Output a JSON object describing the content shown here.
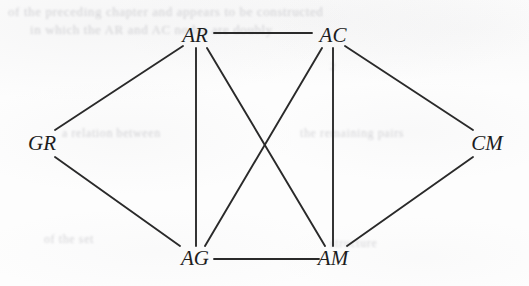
{
  "figure": {
    "background_color": "#fdfdfd",
    "edge_color": "#2a2a2a",
    "label_color": "#1d1d1d",
    "width": 529,
    "height": 286
  },
  "ghost_bleed_text": {
    "description": "faint illegible show-through text from reverse side of page",
    "lines": [
      "of the preceding chapter and appears to be  constructed",
      "in  which  the  AR  and  AC  nodes  are  doubly",
      "a  relation  between",
      "the  remaining  pairs",
      "of  the  set",
      "structure",
      "2"
    ]
  },
  "chart_data": {
    "type": "diagram",
    "diagram_kind": "undirected-graph",
    "title": "",
    "nodes": [
      {
        "id": "AR",
        "label": "AR",
        "x": 195,
        "y": 35,
        "degree": 4
      },
      {
        "id": "AC",
        "label": "AC",
        "x": 333,
        "y": 35,
        "degree": 4
      },
      {
        "id": "GR",
        "label": "GR",
        "x": 42,
        "y": 143,
        "degree": 2
      },
      {
        "id": "CM",
        "label": "CM",
        "x": 487,
        "y": 143,
        "degree": 2
      },
      {
        "id": "AG",
        "label": "AG",
        "x": 195,
        "y": 258,
        "degree": 4
      },
      {
        "id": "AM",
        "label": "AM",
        "x": 333,
        "y": 258,
        "degree": 4
      }
    ],
    "edges": [
      {
        "source": "AR",
        "target": "AC",
        "x1": 214,
        "y1": 33,
        "x2": 312,
        "y2": 33
      },
      {
        "source": "AR",
        "target": "GR",
        "x1": 183,
        "y1": 46,
        "x2": 55,
        "y2": 130
      },
      {
        "source": "AR",
        "target": "AG",
        "x1": 196,
        "y1": 48,
        "x2": 196,
        "y2": 246
      },
      {
        "source": "AR",
        "target": "AM",
        "x1": 207,
        "y1": 48,
        "x2": 325,
        "y2": 246
      },
      {
        "source": "AC",
        "target": "AG",
        "x1": 322,
        "y1": 48,
        "x2": 205,
        "y2": 246
      },
      {
        "source": "AC",
        "target": "AM",
        "x1": 333,
        "y1": 48,
        "x2": 333,
        "y2": 246
      },
      {
        "source": "AC",
        "target": "CM",
        "x1": 345,
        "y1": 46,
        "x2": 473,
        "y2": 130
      },
      {
        "source": "GR",
        "target": "AG",
        "x1": 55,
        "y1": 157,
        "x2": 180,
        "y2": 246
      },
      {
        "source": "AG",
        "target": "AM",
        "x1": 214,
        "y1": 259,
        "x2": 319,
        "y2": 259
      },
      {
        "source": "AM",
        "target": "CM",
        "x1": 347,
        "y1": 246,
        "x2": 473,
        "y2": 157
      }
    ],
    "edge_count": 10,
    "node_count": 6,
    "crossings": [
      {
        "edges": [
          "AR-AM",
          "AC-AG"
        ],
        "x": 266,
        "y": 147
      }
    ],
    "layout_hint": "hexagonal: GR at left apex, CM at right apex, AR/AC across top, AG/AM across bottom"
  }
}
